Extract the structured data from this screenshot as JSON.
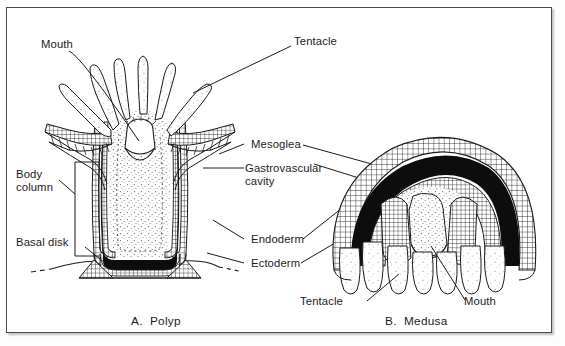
{
  "figure": {
    "type": "biological-line-diagram",
    "background_color": "#ffffff",
    "ink_color": "#1b1b1b",
    "border_color": "#4a4a4a"
  },
  "labels": {
    "mouth_polyp": "Mouth",
    "tentacle_polyp": "Tentacle",
    "body_column": "Body",
    "body_column_line2": "column",
    "basal_disk": "Basal disk",
    "mesoglea": "Mesoglea",
    "gastrovascular": "Gastrovascular",
    "gastrovascular_line2": "cavity",
    "endoderm": "Endoderm",
    "ectoderm": "Ectoderm",
    "tentacle_medusa": "Tentacle",
    "mouth_medusa": "Mouth"
  },
  "captions": {
    "polyp": "A.  Polyp",
    "medusa": "B.  Medusa"
  },
  "panels": [
    {
      "id": "polyp",
      "caption": "A.  Polyp",
      "labels": [
        "Mouth",
        "Tentacle",
        "Body column",
        "Basal disk"
      ]
    },
    {
      "id": "medusa",
      "caption": "B.  Medusa",
      "labels": [
        "Tentacle",
        "Mouth"
      ]
    }
  ],
  "shared_labels": [
    "Mesoglea",
    "Gastrovascular cavity",
    "Endoderm",
    "Ectoderm"
  ],
  "tissue_layers": {
    "ectoderm_pattern": "cross-hatched grid",
    "mesoglea_pattern": "solid black band",
    "endoderm_pattern": "cross-hatched grid",
    "cavity_pattern": "stippled"
  }
}
